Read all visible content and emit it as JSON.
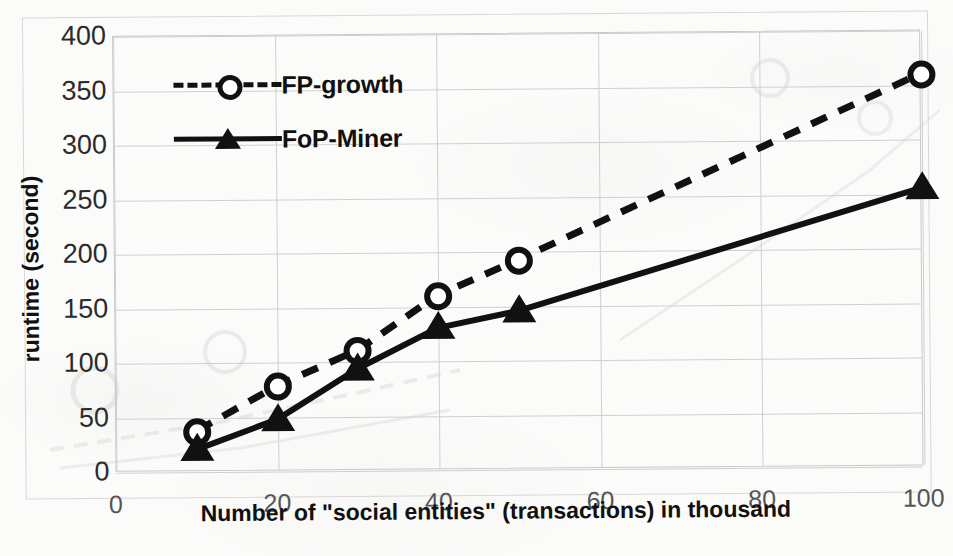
{
  "chart_data": {
    "type": "line",
    "title": "",
    "xlabel": "Number of \"social entities\" (transactions) in thousand",
    "ylabel": "runtime (second)",
    "x": [
      10,
      20,
      30,
      40,
      50,
      100
    ],
    "xlim": [
      0,
      100
    ],
    "ylim": [
      0,
      400
    ],
    "x_ticks": [
      "0",
      "20",
      "40",
      "60",
      "80",
      "100"
    ],
    "x_tick_values": [
      0,
      20,
      40,
      60,
      80,
      100
    ],
    "y_ticks": [
      "0",
      "50",
      "100",
      "150",
      "200",
      "250",
      "300",
      "350",
      "400"
    ],
    "y_tick_values": [
      0,
      50,
      100,
      150,
      200,
      250,
      300,
      350,
      400
    ],
    "grid": "both",
    "legend_position": "top-left",
    "series": [
      {
        "name": "FP-growth",
        "values": [
          37,
          78,
          110,
          160,
          192,
          360
        ],
        "line_style": "dashed",
        "marker": "circle-open",
        "color": "#111111"
      },
      {
        "name": "FoP-Miner",
        "values": [
          20,
          47,
          93,
          130,
          145,
          255
        ],
        "line_style": "solid",
        "marker": "triangle-filled",
        "color": "#111111"
      }
    ]
  },
  "legend": {
    "items": [
      {
        "label": "FP-growth",
        "style": "dashed",
        "marker": "circle-open"
      },
      {
        "label": "FoP-Miner",
        "style": "solid",
        "marker": "triangle-filled"
      }
    ]
  },
  "axes": {
    "y_title": "runtime (second)",
    "x_title": "Number of \"social entities\" (transactions) in thousand"
  },
  "colors": {
    "ink": "#111111",
    "grid": "#cfcfcf",
    "frame": "#c9c9c9",
    "page": "#fbfbfa"
  }
}
